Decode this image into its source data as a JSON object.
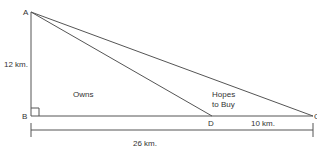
{
  "diagram": {
    "type": "right-triangle-land-plot",
    "points": {
      "A": {
        "label": "A",
        "x": 31,
        "y": 12
      },
      "B": {
        "label": "B",
        "x": 31,
        "y": 116
      },
      "D": {
        "label": "D",
        "x": 212,
        "y": 116
      },
      "C": {
        "label": "C",
        "x": 313,
        "y": 116
      }
    },
    "labels": {
      "side_ab": "12 km.",
      "region_owns": "Owns",
      "region_hopes_line1": "Hopes",
      "region_hopes_line2": "to Buy",
      "segment_dc": "10 km.",
      "base_total": "26 km."
    },
    "colors": {
      "line": "#555555",
      "text": "#333333"
    }
  }
}
